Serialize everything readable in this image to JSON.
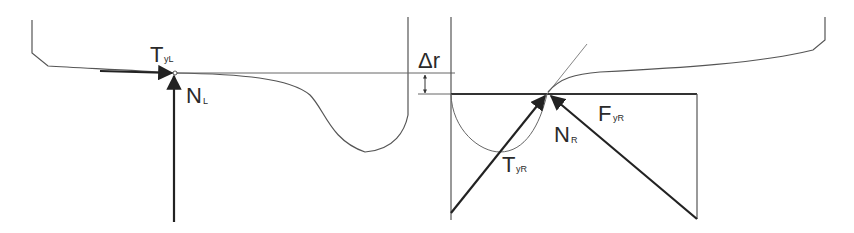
{
  "diagram": {
    "colors": {
      "line": "#555555",
      "arrow": "#222222",
      "background": "#ffffff"
    },
    "labels": {
      "tangential_left": {
        "main": "T",
        "sub": "yL"
      },
      "normal_left": {
        "main": "N",
        "sub": "L"
      },
      "delta_r": {
        "main": "Δr"
      },
      "tangential_right": {
        "main": "T",
        "sub": "yR"
      },
      "normal_right": {
        "main": "N",
        "sub": "R"
      },
      "force_right": {
        "main": "F",
        "sub": "yR"
      }
    }
  }
}
